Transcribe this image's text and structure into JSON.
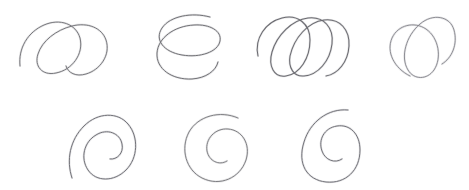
{
  "sheet": {
    "title": "Hand-drawn spiral sketches",
    "width": 469,
    "height": 190,
    "background_color": "#ffffff",
    "medium": "pencil",
    "figure_count": 7,
    "row_counts": [
      4,
      3
    ]
  },
  "ink": {
    "graphite_color": "#6b6b70",
    "graphite_dark": "#5a5a60",
    "graphite_light": "#8e8e95",
    "stroke_width": 1.0
  },
  "figures": [
    {
      "id": "spiral-1",
      "label": "coil spiral with two leaning loops",
      "row": 1,
      "column": 1,
      "type": "coil",
      "loops": 2,
      "x": 14,
      "y": 8,
      "width": 108,
      "height": 72,
      "color": "#6f6f74",
      "opacity": 0.92,
      "stroke_width": 1.0,
      "path": "M6 58 C4 40 14 24 30 17 C46 10 62 16 66 30 C70 46 58 62 42 65 C28 68 20 58 24 46 C28 33 42 22 58 18 C74 14 88 20 92 32 C97 47 86 62 72 66 C62 69 54 65 52 58"
    },
    {
      "id": "spiral-2",
      "label": "open C-shaped coil with stacked loops",
      "row": 1,
      "column": 2,
      "type": "coil-open",
      "loops": 2,
      "x": 148,
      "y": 10,
      "width": 82,
      "height": 70,
      "color": "#6b6b70",
      "opacity": 0.95,
      "stroke_width": 1.0,
      "path": "M62 7 C44 2 22 6 14 18 C6 30 16 42 34 45 C52 48 70 42 72 31 C74 21 62 14 46 15 C26 16 10 28 9 43 C8 59 24 70 44 69 C58 68 68 61 70 52"
    },
    {
      "id": "spiral-3",
      "label": "wide coil spiral with three loops",
      "row": 1,
      "column": 3,
      "type": "coil",
      "loops": 3,
      "x": 250,
      "y": 10,
      "width": 106,
      "height": 72,
      "color": "#6a6a70",
      "opacity": 1.0,
      "stroke_width": 1.05,
      "path": "M8 46 C4 28 16 12 32 8 C48 4 60 14 60 30 C60 48 50 64 36 66 C24 68 18 56 22 42 C27 25 42 10 58 8 C74 6 84 18 82 34 C80 51 68 65 54 66 C44 67 38 58 40 46 C44 28 58 12 74 10 C90 8 100 20 99 36 C98 52 88 64 76 66"
    },
    {
      "id": "spiral-4",
      "label": "light coil spiral with two offset loops",
      "row": 1,
      "column": 4,
      "type": "coil",
      "loops": 2,
      "x": 382,
      "y": 10,
      "width": 78,
      "height": 72,
      "color": "#7c7c83",
      "opacity": 0.88,
      "stroke_width": 0.95,
      "path": "M28 66 C12 58 4 42 10 28 C16 15 32 11 44 19 C57 28 60 48 52 60 C45 70 32 70 26 60 C18 47 24 26 38 14 C51 3 68 6 72 20 C76 34 70 48 60 54"
    },
    {
      "id": "spiral-5",
      "label": "tight inward archimedean spiral, oval",
      "row": 2,
      "column": 1,
      "type": "archimedean",
      "turns": 2,
      "x": 66,
      "y": 106,
      "width": 74,
      "height": 76,
      "color": "#6d6d73",
      "opacity": 0.95,
      "stroke_width": 1.0,
      "path": "M6 72 C0 54 4 34 18 20 C32 6 52 6 62 18 C73 31 72 52 60 64 C48 76 30 76 22 64 C14 52 18 36 30 29 C41 22 54 27 56 38 C58 47 51 54 44 53"
    },
    {
      "id": "spiral-6",
      "label": "round archimedean spiral with inward tail",
      "row": 2,
      "column": 2,
      "type": "archimedean",
      "turns": 2,
      "x": 180,
      "y": 108,
      "width": 74,
      "height": 72,
      "color": "#747479",
      "opacity": 0.9,
      "stroke_width": 1.0,
      "path": "M58 10 C40 2 18 8 9 24 C0 41 6 62 22 70 C40 79 60 70 66 52 C71 36 62 22 48 21 C35 20 25 31 27 43 C29 53 39 58 47 53"
    },
    {
      "id": "spiral-7",
      "label": "tall archimedean spiral with hooked centre",
      "row": 2,
      "column": 3,
      "type": "archimedean",
      "turns": 2,
      "x": 294,
      "y": 104,
      "width": 78,
      "height": 80,
      "color": "#6e6e74",
      "opacity": 0.95,
      "stroke_width": 1.0,
      "path": "M54 6 C34 4 16 18 10 38 C3 60 13 76 32 78 C52 80 66 66 66 46 C66 30 56 20 43 22 C30 24 24 36 28 47 C31 56 41 60 48 55"
    }
  ]
}
